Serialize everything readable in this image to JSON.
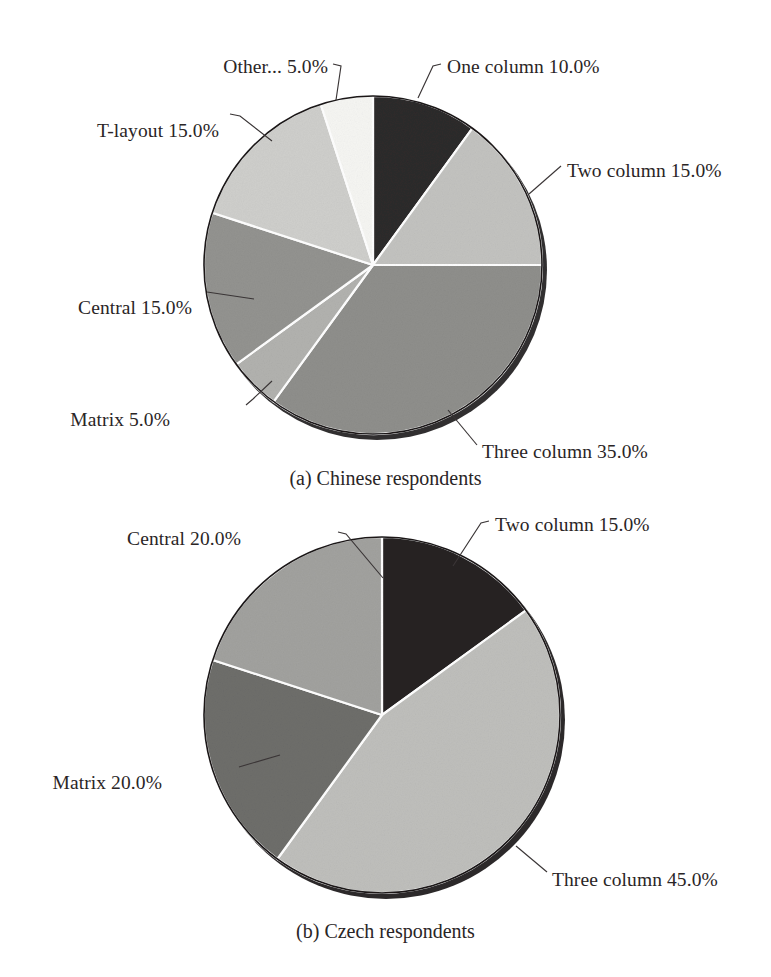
{
  "figure": {
    "background": "#ffffff",
    "text_color": "#2a2526",
    "leader_color": "#3a3536",
    "edge_color": "#1a1718",
    "separator_color": "#ffffff"
  },
  "captions": {
    "a": "(a) Chinese respondents",
    "b": "(b) Czech respondents"
  },
  "chart_data": [
    {
      "type": "pie",
      "title": "(a) Chinese respondents",
      "id": "chinese-respondents",
      "start_angle_deg": 90,
      "direction": "clockwise",
      "total": 100,
      "units": "%",
      "categories": [
        "One column",
        "Two column",
        "Three column",
        "Matrix",
        "Central",
        "T-layout",
        "Other..."
      ],
      "values": [
        10.0,
        15.0,
        35.0,
        5.0,
        15.0,
        15.0,
        5.0
      ],
      "labels": [
        "One column 10.0%",
        "Two column 15.0%",
        "Three column 35.0%",
        "Matrix 5.0%",
        "Central 15.0%",
        "T-layout 15.0%",
        "Other... 5.0%"
      ],
      "colors": [
        "#2d2a2b",
        "#c3c3c0",
        "#8f8f8c",
        "#b2b2af",
        "#939390",
        "#cfcfcc",
        "#f6f6f3"
      ],
      "legend": "none",
      "grid": false
    },
    {
      "type": "pie",
      "title": "(b) Czech respondents",
      "id": "czech-respondents",
      "start_angle_deg": 90,
      "direction": "clockwise",
      "total": 100,
      "units": "%",
      "categories": [
        "Two column",
        "Three column",
        "Matrix",
        "Central"
      ],
      "values": [
        15.0,
        45.0,
        20.0,
        20.0
      ],
      "labels": [
        "Two column 15.0%",
        "Three column 45.0%",
        "Matrix 20.0%",
        "Central 20.0%"
      ],
      "colors": [
        "#262324",
        "#bfbfbc",
        "#6e6e6b",
        "#a2a29f"
      ],
      "legend": "none",
      "grid": false
    }
  ],
  "annotations": {
    "a": [
      {
        "name": "one-column",
        "text": "One column 10.0%",
        "x": 447,
        "y": 56,
        "align": "left"
      },
      {
        "name": "two-column",
        "text": "Two column 15.0%",
        "x": 567,
        "y": 160,
        "align": "left"
      },
      {
        "name": "three-column",
        "text": "Three column 35.0%",
        "x": 482,
        "y": 441,
        "align": "left"
      },
      {
        "name": "matrix",
        "text": "Matrix 5.0%",
        "x": 170,
        "y": 409,
        "align": "right"
      },
      {
        "name": "central",
        "text": "Central 15.0%",
        "x": 192,
        "y": 297,
        "align": "right"
      },
      {
        "name": "t-layout",
        "text": "T-layout 15.0%",
        "x": 219,
        "y": 120,
        "align": "right"
      },
      {
        "name": "other",
        "text": "Other... 5.0%",
        "x": 328,
        "y": 56,
        "align": "right"
      }
    ],
    "b": [
      {
        "name": "two-column",
        "text": "Two column 15.0%",
        "x": 495,
        "y": 514,
        "align": "left"
      },
      {
        "name": "three-column",
        "text": "Three column 45.0%",
        "x": 552,
        "y": 869,
        "align": "left"
      },
      {
        "name": "matrix",
        "text": "Matrix 20.0%",
        "x": 162,
        "y": 772,
        "align": "right"
      },
      {
        "name": "central",
        "text": "Central 20.0%",
        "x": 241,
        "y": 528,
        "align": "right"
      }
    ]
  },
  "geometry": {
    "pie_a": {
      "cx": 373,
      "cy": 265,
      "r": 169
    },
    "pie_b": {
      "cx": 382,
      "cy": 715,
      "r": 178
    }
  },
  "leaders": {
    "a": [
      {
        "name": "leader-one-column",
        "d": "M 441 64 L 433 66 L 418 98"
      },
      {
        "name": "leader-two-column",
        "d": "M 561 166 L 529 194"
      },
      {
        "name": "leader-three-column",
        "d": "M 477 445 L 448 410"
      },
      {
        "name": "leader-matrix",
        "d": "M 246 405 L 253 399 L 272 381"
      },
      {
        "name": "leader-central",
        "d": "M 254 299 L 207 292"
      },
      {
        "name": "leader-t-layout",
        "d": "M 230 114 L 240 116 L 272 141"
      },
      {
        "name": "leader-other",
        "d": "M 333 64 L 341 66 L 336 100"
      }
    ],
    "b": [
      {
        "name": "leader-two-column",
        "d": "M 489 521 L 481 523 L 453 566"
      },
      {
        "name": "leader-three-column",
        "d": "M 547 872 L 516 846"
      },
      {
        "name": "leader-matrix",
        "d": "M 239 767 L 280 755"
      },
      {
        "name": "leader-central",
        "d": "M 338 532 L 346 534 L 383 578"
      }
    ]
  }
}
